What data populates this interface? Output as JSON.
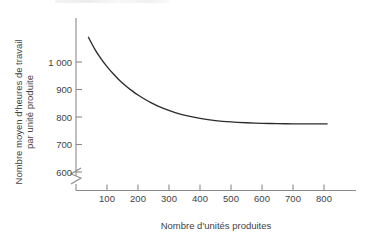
{
  "figure": {
    "header_fragment": "",
    "background_color": "#ffffff",
    "curve_color": "#2b2b2b",
    "axis_color": "#8a8a8a",
    "text_color": "#3f3f3f"
  },
  "chart_data": {
    "type": "line",
    "title": "",
    "xlabel": "Nombre d'unités produites",
    "ylabel": "Nombre moyen d'heures de travail par unité produite",
    "ylabel_lines": [
      "Nombre moyen d'heures de travail",
      "par unité produite"
    ],
    "xlim": [
      0,
      880
    ],
    "ylim": [
      560,
      1120
    ],
    "y_axis_break": true,
    "y_axis_break_label": "axis-break",
    "grid": false,
    "legend": null,
    "xticks": [
      100,
      200,
      300,
      400,
      500,
      600,
      700,
      800
    ],
    "xticklabels": [
      "100",
      "200",
      "300",
      "400",
      "500",
      "600",
      "700",
      "800"
    ],
    "yticks": [
      600,
      700,
      800,
      900,
      1000
    ],
    "yticklabels": [
      "600",
      "700",
      "800",
      "900",
      "1 000"
    ],
    "series": [
      {
        "name": "Courbe d'apprentissage",
        "x": [
          40,
          60,
          80,
          100,
          120,
          140,
          160,
          180,
          200,
          240,
          280,
          320,
          360,
          400,
          450,
          500,
          550,
          600,
          650,
          700,
          750,
          810
        ],
        "values": [
          1090,
          1048,
          1013,
          983,
          957,
          934,
          914,
          896,
          880,
          853,
          832,
          816,
          804,
          795,
          787,
          782,
          779,
          777,
          776,
          775,
          775,
          775
        ]
      }
    ]
  }
}
